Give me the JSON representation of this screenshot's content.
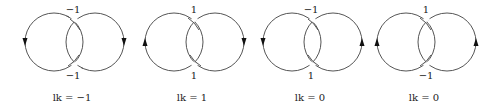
{
  "figure": {
    "stroke_color": "#555555",
    "arrow_color": "#111111",
    "panels": [
      {
        "top_crossing_sign": "−1",
        "bottom_crossing_sign": "−1",
        "left_arrow": "down",
        "right_arrow": "down",
        "linking_number_label": "lk = −1"
      },
      {
        "top_crossing_sign": "1",
        "bottom_crossing_sign": "1",
        "left_arrow": "up",
        "right_arrow": "down",
        "linking_number_label": "lk = 1"
      },
      {
        "top_crossing_sign": "−1",
        "bottom_crossing_sign": "1",
        "left_arrow": "down",
        "right_arrow": "up",
        "linking_number_label": "lk = 0"
      },
      {
        "top_crossing_sign": "1",
        "bottom_crossing_sign": "−1",
        "left_arrow": "up",
        "right_arrow": "up",
        "linking_number_label": "lk = 0"
      }
    ]
  }
}
